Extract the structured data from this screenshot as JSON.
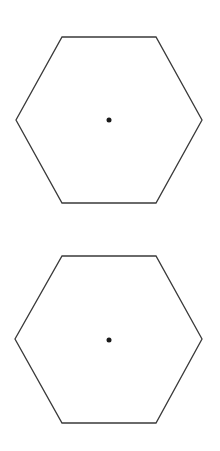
{
  "diagram": {
    "background": "#ffffff",
    "stroke_color": "#3a3a3a",
    "dot_color": "#1a1a1a",
    "shapes": [
      {
        "type": "hexagon",
        "orientation": "flat-top",
        "points": "62,37 156,37 202,120 156,203 62,203 16,120",
        "center": {
          "x": 109,
          "y": 120
        },
        "center_dot_radius": 2.5
      },
      {
        "type": "hexagon",
        "orientation": "flat-top",
        "points": "62,256 156,256 202,339 156,423 62,423 15,339",
        "center": {
          "x": 109,
          "y": 340
        },
        "center_dot_radius": 2.5
      }
    ]
  }
}
